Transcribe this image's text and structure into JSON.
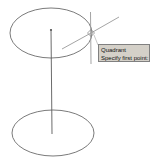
{
  "app": {
    "kind": "cad-viewport",
    "background_color": "#ffffff",
    "width": 157,
    "height": 168
  },
  "drawing": {
    "name": "cylinder-wireframe",
    "line_color": "#6b6b6b",
    "axis_color": "#5a5a5a",
    "crosshair_color": "#9a9a9a",
    "top_ellipse": {
      "label": "top-ellipse",
      "cx": 51,
      "cy": 33,
      "rx": 41,
      "ry": 25
    },
    "bottom_ellipse": {
      "label": "bottom-ellipse",
      "cx": 53,
      "cy": 133,
      "rx": 41,
      "ry": 23
    },
    "center_axis": {
      "label": "center-axis-line",
      "x1": 51,
      "y1": 29,
      "x2": 52,
      "y2": 134
    },
    "axis_top_marker": {
      "label": "axis-endpoint-marker",
      "cx": 51,
      "cy": 30,
      "r": 1.2
    }
  },
  "cursor": {
    "name": "crosshair-cursor",
    "snap_point": {
      "x": 91,
      "y": 33
    },
    "vertical_line": {
      "x1": 90,
      "y1": 12,
      "x2": 91,
      "y2": 64
    },
    "pick_line_upper_right": {
      "x1": 91,
      "y1": 33,
      "x2": 119,
      "y2": 17
    },
    "pick_line_lower_left": {
      "x1": 91,
      "y1": 33,
      "x2": 62,
      "y2": 49
    },
    "marker_size": 7
  },
  "tooltip": {
    "name": "osnap-tooltip",
    "background_color": "#d4d0c8",
    "border_color": "#808080",
    "text_color": "#101010",
    "snap_mode": "Quadrant",
    "prompt": "Specify first point:"
  }
}
